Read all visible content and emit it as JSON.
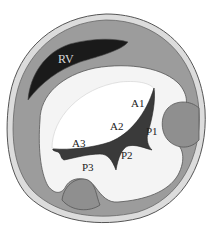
{
  "diagram": {
    "labels": {
      "rv": "RV",
      "a1": "A1",
      "a2": "A2",
      "a3": "A3",
      "p1": "P1",
      "p2": "P2",
      "p3": "P3"
    },
    "colors": {
      "background": "#ffffff",
      "outer_rim": "#d9d9d9",
      "myocardium": "#9a9a9a",
      "rv_cavity": "#1a1a1a",
      "lv_cavity": "#f4f4f4",
      "leaflet_highlight": "#ffffff",
      "orifice": "#3a3a3a",
      "papillary": "#8f8f8f",
      "outline": "#555555"
    }
  }
}
